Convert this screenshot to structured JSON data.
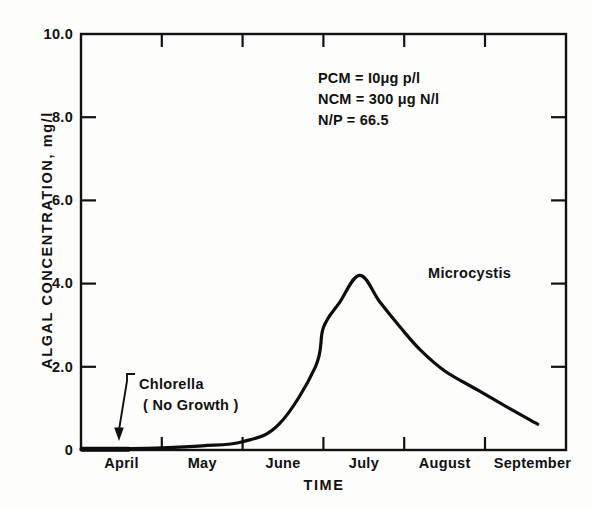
{
  "chart_data": {
    "type": "line",
    "title": "",
    "xlabel": "TIME",
    "ylabel": "ALGAL CONCENTRATION, mg/l",
    "xlim": [
      0,
      6
    ],
    "ylim": [
      0,
      10.0
    ],
    "grid": false,
    "legend": "inline-annotations",
    "x_categories": [
      "April",
      "May",
      "June",
      "July",
      "August",
      "September"
    ],
    "x_tick_labels": [
      "April",
      "May",
      "June",
      "July",
      "August",
      "September"
    ],
    "y_tick_labels": [
      "0",
      "2.0",
      "4.0",
      "6.0",
      "8.0",
      "10.0"
    ],
    "y_tick_values": [
      0,
      2.0,
      4.0,
      6.0,
      8.0,
      10.0
    ],
    "series": [
      {
        "name": "Microcystis",
        "x": [
          0.0,
          0.5,
          1.0,
          1.5,
          2.0,
          2.45,
          2.9,
          3.0,
          3.2,
          3.45,
          3.7,
          3.95,
          4.2,
          4.5,
          4.9,
          5.3,
          5.65
        ],
        "values": [
          0.02,
          0.03,
          0.05,
          0.1,
          0.2,
          0.62,
          2.0,
          2.95,
          3.55,
          4.2,
          3.55,
          2.95,
          2.4,
          1.9,
          1.45,
          1.0,
          0.62
        ]
      },
      {
        "name": "Chlorella",
        "x": [
          0.0,
          0.6
        ],
        "values": [
          0.02,
          0.02
        ],
        "note": "No Growth"
      }
    ],
    "annotations": {
      "pcm": "PCM = I0μg p/l",
      "ncm": "NCM = 300 μg N/l",
      "np": "N/P = 66.5",
      "microcystis_label": "Microcystis",
      "chlorella_label": "Chlorella",
      "chlorella_sub": "( No Growth )"
    }
  },
  "axis": {
    "y_title": "ALGAL CONCENTRATION, mg/l",
    "x_title": "TIME",
    "y_ticks": [
      {
        "label": "10.0",
        "value": 10.0
      },
      {
        "label": "8.0",
        "value": 8.0
      },
      {
        "label": "6.0",
        "value": 6.0
      },
      {
        "label": "4.0",
        "value": 4.0
      },
      {
        "label": "2.0",
        "value": 2.0
      },
      {
        "label": "0",
        "value": 0
      }
    ],
    "x_ticks": [
      {
        "label": "April"
      },
      {
        "label": "May"
      },
      {
        "label": "June"
      },
      {
        "label": "July"
      },
      {
        "label": "August"
      },
      {
        "label": "September"
      }
    ]
  },
  "colors": {
    "ink": "#111111",
    "paper": "#fdfdfc",
    "curve": "#0d0d0d"
  }
}
